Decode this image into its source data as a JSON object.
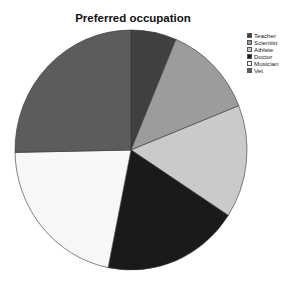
{
  "chart_data": {
    "type": "pie",
    "title": "Preferred occupation",
    "categories": [
      "Teacher",
      "Scientist",
      "Athlete",
      "Doctor",
      "Musician",
      "Vet"
    ],
    "values": [
      5,
      10,
      12,
      15,
      17,
      20
    ],
    "colors": [
      "#404040",
      "#9c9c9c",
      "#cacaca",
      "#1a1a1a",
      "#f7f7f7",
      "#5c5c5c"
    ],
    "start_angle_deg": 0,
    "direction": "clockwise",
    "legend_position": "top-right"
  },
  "legend": {
    "items": [
      {
        "label": "Teacher",
        "color": "#404040"
      },
      {
        "label": "Scientist",
        "color": "#9c9c9c"
      },
      {
        "label": "Athlete",
        "color": "#cacaca"
      },
      {
        "label": "Doctor",
        "color": "#1a1a1a"
      },
      {
        "label": "Musician",
        "color": "#f7f7f7"
      },
      {
        "label": "Vet",
        "color": "#5c5c5c"
      }
    ]
  }
}
